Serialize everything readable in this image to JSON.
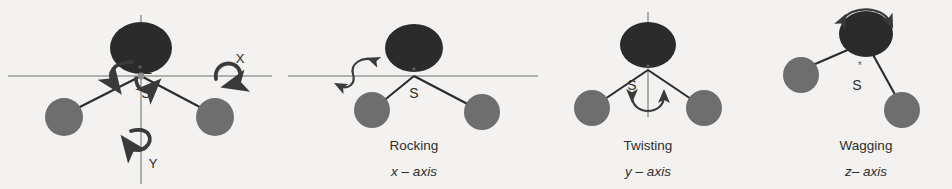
{
  "figure": {
    "background_color": "#f3f2f0",
    "large_atom_color": "#2b2b2b",
    "small_atom_color": "#6e6e6e",
    "bond_color": "#2b2b2b",
    "axis_line_color": "#9a9a9a",
    "arrow_color": "#3a3a3a",
    "width": 952,
    "height": 189
  },
  "panels": [
    {
      "id": "axes-reference",
      "title": "",
      "axis": "",
      "center_label": "S",
      "axis_labels": {
        "z": "Z",
        "y": "Y",
        "x": "X"
      },
      "star": "*",
      "has_horizontal_axis": true,
      "has_vertical_axis": true
    },
    {
      "id": "rocking",
      "title": "Rocking",
      "axis": "x – axis",
      "center_label": "S",
      "star": "*",
      "has_horizontal_axis": true,
      "has_vertical_axis": false
    },
    {
      "id": "twisting",
      "title": "Twisting",
      "axis": "y – axis",
      "center_label": "S",
      "star": "*",
      "has_horizontal_axis": false,
      "has_vertical_axis": true
    },
    {
      "id": "wagging",
      "title": "Wagging",
      "axis": "z– axis",
      "center_label": "S",
      "star": "*",
      "has_horizontal_axis": false,
      "has_vertical_axis": false
    }
  ]
}
